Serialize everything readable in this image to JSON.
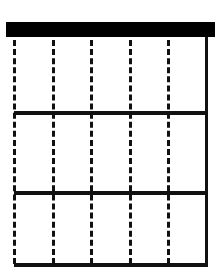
{
  "diagram": {
    "type": "grid",
    "rows": 3,
    "dashed_columns": 5,
    "colors": {
      "line": "#111111",
      "header_bar": "#000000",
      "background": "#ffffff"
    },
    "header_bar": {
      "x": 6,
      "y": 22,
      "width": 209,
      "height": 15
    },
    "right_border": {
      "x": 205,
      "y": 37,
      "width": 3,
      "height": 230
    },
    "horizontal_lines": [
      {
        "x": 14,
        "y": 111,
        "width": 193,
        "height": 4
      },
      {
        "x": 14,
        "y": 191,
        "width": 193,
        "height": 4
      },
      {
        "x": 14,
        "y": 263,
        "width": 193,
        "height": 4
      }
    ],
    "dashed_lines_x": [
      13,
      52,
      90,
      129,
      167
    ],
    "dashed_top": 40,
    "dashed_bottom": 264
  }
}
